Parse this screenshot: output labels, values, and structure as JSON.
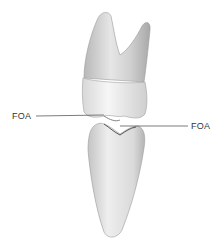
{
  "figure": {
    "labels": {
      "left": "FOA",
      "right": "FOA"
    }
  }
}
